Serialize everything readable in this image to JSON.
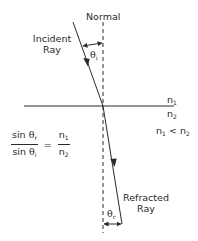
{
  "diagram": {
    "type": "refraction-snells-law",
    "labels": {
      "normal": "Normal",
      "incident_ray_line1": "Incident",
      "incident_ray_line2": "Ray",
      "refracted_ray_line1": "Refracted",
      "refracted_ray_line2": "Ray",
      "theta_symbol": "θ",
      "theta_incident_sub": "i",
      "theta_refracted_sub": "r",
      "n_symbol": "n",
      "medium1_sub": "1",
      "medium2_sub": "2",
      "inequality": "<"
    },
    "formula": {
      "lhs_num_text": "sin ",
      "lhs_num_sub": "r",
      "lhs_den_text": "sin ",
      "lhs_den_sub": "i",
      "equals": "=",
      "rhs_num_sub": "1",
      "rhs_den_sub": "2"
    },
    "colors": {
      "line": "#2a2a2a",
      "text": "#2a2a2a",
      "background": "#ffffff"
    }
  }
}
